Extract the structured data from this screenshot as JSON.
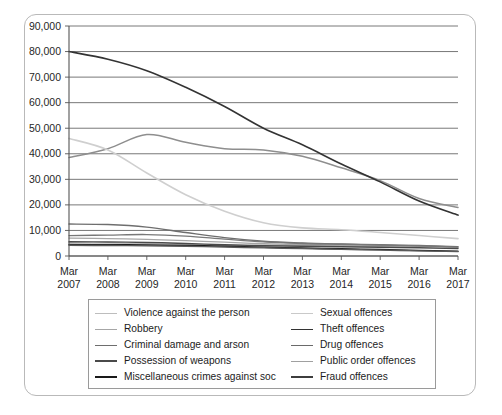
{
  "chart_data": {
    "type": "line",
    "title": "",
    "subtitle": "",
    "xlabel": "",
    "ylabel": "",
    "grid": "horizontal",
    "legend_position": "bottom",
    "ylim": [
      0,
      90000
    ],
    "yticks": [
      "0",
      "10,000",
      "20,000",
      "30,000",
      "40,000",
      "50,000",
      "60,000",
      "70,000",
      "80,000",
      "90,000"
    ],
    "ytick_values": [
      0,
      10000,
      20000,
      30000,
      40000,
      50000,
      60000,
      70000,
      80000,
      90000
    ],
    "categories": [
      "Mar\n2007",
      "Mar\n2008",
      "Mar\n2009",
      "Mar\n2010",
      "Mar\n2011",
      "Mar\n2012",
      "Mar\n2013",
      "Mar\n2014",
      "Mar\n2015",
      "Mar\n2016",
      "Mar\n2017"
    ],
    "xtick_top": [
      "Mar",
      "Mar",
      "Mar",
      "Mar",
      "Mar",
      "Mar",
      "Mar",
      "Mar",
      "Mar",
      "Mar",
      "Mar"
    ],
    "xtick_bottom": [
      "2007",
      "2008",
      "2009",
      "2010",
      "2011",
      "2012",
      "2013",
      "2014",
      "2015",
      "2016",
      "2017"
    ],
    "series": [
      {
        "name": "Violence against the person",
        "color": "#8e8e8e",
        "width": 1.5,
        "values": [
          38500,
          42000,
          47500,
          44500,
          42000,
          41500,
          39000,
          34500,
          29500,
          22500,
          19000
        ]
      },
      {
        "name": "Sexual offences",
        "color": "#bdbdbd",
        "width": 1.3,
        "values": [
          5200,
          5000,
          4800,
          4500,
          4300,
          4200,
          4100,
          3900,
          3700,
          3400,
          3000
        ]
      },
      {
        "name": "Robbery",
        "color": "#a6a6a6",
        "width": 1.3,
        "values": [
          7000,
          6800,
          6500,
          6000,
          5400,
          4800,
          4400,
          4200,
          4000,
          3800,
          3400
        ]
      },
      {
        "name": "Theft offences",
        "color": "#333333",
        "width": 1.6,
        "values": [
          80000,
          77000,
          72500,
          66000,
          58500,
          50000,
          43500,
          36000,
          29000,
          21500,
          16000
        ]
      },
      {
        "name": "Criminal damage and arson",
        "color": "#6e6e6e",
        "width": 1.4,
        "values": [
          12500,
          12300,
          11300,
          9200,
          7200,
          5800,
          5100,
          4700,
          4400,
          4100,
          3600
        ]
      },
      {
        "name": "Drug offences",
        "color": "#787878",
        "width": 1.3,
        "values": [
          8000,
          8200,
          8400,
          7800,
          6600,
          5500,
          4900,
          4600,
          4300,
          4000,
          3500
        ]
      },
      {
        "name": "Possession of weapons",
        "color": "#4a4a4a",
        "width": 1.4,
        "values": [
          5600,
          5500,
          5300,
          4900,
          4400,
          4000,
          3800,
          3600,
          3400,
          3200,
          2900
        ]
      },
      {
        "name": "Public order offences",
        "color": "#cfcfcf",
        "width": 1.6,
        "values": [
          46000,
          41500,
          32500,
          24000,
          17500,
          13000,
          11000,
          10300,
          9200,
          8000,
          6800
        ]
      },
      {
        "name": "Miscellaneous crimes against soc",
        "color": "#1a1a1a",
        "width": 1.5,
        "values": [
          4500,
          4400,
          4300,
          4100,
          3800,
          3400,
          3100,
          2800,
          2500,
          2200,
          1900
        ]
      },
      {
        "name": "Fraud offences",
        "color": "#5a5a5a",
        "width": 1.4,
        "values": [
          4200,
          4100,
          4000,
          3800,
          3500,
          3200,
          2900,
          2600,
          2300,
          2000,
          1700
        ]
      }
    ]
  },
  "legend": {
    "column_left": [
      {
        "label": "Violence against the person",
        "color": "#bdbdbd"
      },
      {
        "label": "Robbery",
        "color": "#a6a6a6"
      },
      {
        "label": "Criminal damage and arson",
        "color": "#6e6e6e"
      },
      {
        "label": "Possession of weapons",
        "color": "#4a4a4a"
      },
      {
        "label": "Miscellaneous crimes against soc",
        "color": "#1a1a1a"
      }
    ],
    "column_right": [
      {
        "label": "Sexual offences",
        "color": "#c9c9c9"
      },
      {
        "label": "Theft offences",
        "color": "#333333"
      },
      {
        "label": "Drug offences",
        "color": "#6a6a6a"
      },
      {
        "label": "Public order offences",
        "color": "#a0a0a0"
      },
      {
        "label": "Fraud offences",
        "color": "#3d3d3d"
      }
    ]
  },
  "axes": {
    "gridline_color": "#555555",
    "axis_color": "#555555",
    "frame_color": "#b9b9b9"
  }
}
